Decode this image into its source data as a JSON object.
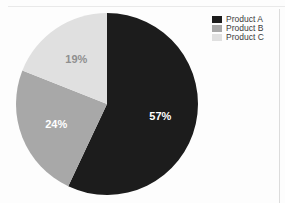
{
  "chart_data": {
    "type": "pie",
    "title": "",
    "categories": [
      "Product A",
      "Product B",
      "Product C"
    ],
    "values": [
      57,
      24,
      19
    ],
    "value_labels": [
      "57%",
      "24%",
      "19%"
    ],
    "colors": [
      "#1c1c1c",
      "#a8a8a8",
      "#e0e0e0"
    ],
    "label_colors": [
      "#ffffff",
      "#ffffff",
      "#8f8f8f"
    ],
    "start_angle_deg": 0,
    "direction": "clockwise",
    "units": "percent",
    "legend_position": "right"
  },
  "legend": {
    "items": [
      {
        "label": "Product A",
        "color": "#1c1c1c"
      },
      {
        "label": "Product B",
        "color": "#a8a8a8"
      },
      {
        "label": "Product C",
        "color": "#e0e0e0"
      }
    ]
  },
  "slices": [
    {
      "name": "Product A",
      "label": "57%"
    },
    {
      "name": "Product B",
      "label": "24%"
    },
    {
      "name": "Product C",
      "label": "19%"
    }
  ]
}
